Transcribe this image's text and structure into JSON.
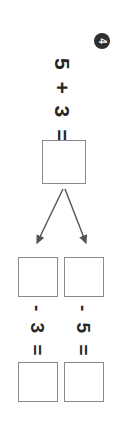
{
  "page": {
    "orientation": "rotated-90-clockwise",
    "background_color": "#ffffff",
    "ink_color": "#262626",
    "box_border_color": "#8a8a8a",
    "badge_color": "#2f2f2f"
  },
  "problem": {
    "number": "4",
    "main_equation": "5 + 3 =",
    "main_answer": "",
    "branches": [
      {
        "position": "left",
        "top_answer": "",
        "equation": "- 3 =",
        "bottom_answer": ""
      },
      {
        "position": "right",
        "top_answer": "",
        "equation": "- 5 =",
        "bottom_answer": ""
      }
    ]
  }
}
